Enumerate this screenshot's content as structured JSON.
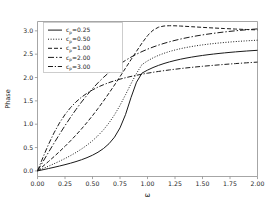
{
  "figure": {
    "background": "#ffffff",
    "line_color": "#1a1a1a",
    "axis_color": "#8f8f8f"
  },
  "chart_data": {
    "type": "line",
    "title": "",
    "xlabel": "ω",
    "ylabel": "Phase",
    "xlim": [
      0.0,
      2.0
    ],
    "ylim": [
      -0.12,
      3.2
    ],
    "grid": false,
    "legend_position": "upper left",
    "xticks": [
      "0.00",
      "0.25",
      "0.50",
      "0.75",
      "1.00",
      "1.25",
      "1.50",
      "1.75",
      "2.00"
    ],
    "xtick_values": [
      0.0,
      0.25,
      0.5,
      0.75,
      1.0,
      1.25,
      1.5,
      1.75,
      2.0
    ],
    "yticks": [
      "0.0",
      "0.5",
      "1.0",
      "1.5",
      "2.0",
      "2.5",
      "3.0"
    ],
    "ytick_values": [
      0.0,
      0.5,
      1.0,
      1.5,
      2.0,
      2.5,
      3.0
    ],
    "x": [
      0.0,
      0.05,
      0.1,
      0.15,
      0.2,
      0.25,
      0.3,
      0.35,
      0.4,
      0.45,
      0.5,
      0.55,
      0.6,
      0.65,
      0.7,
      0.75,
      0.8,
      0.85,
      0.9,
      0.95,
      1.0,
      1.05,
      1.1,
      1.15,
      1.2,
      1.25,
      1.3,
      1.35,
      1.4,
      1.45,
      1.5,
      1.55,
      1.6,
      1.65,
      1.7,
      1.75,
      1.8,
      1.85,
      1.9,
      1.95,
      2.0
    ],
    "series": [
      {
        "name": "c_p=0.25",
        "param": 0.25,
        "linestyle": "solid",
        "dash": "none",
        "values": [
          0.0,
          0.025,
          0.0505,
          0.0767,
          0.1042,
          0.1334,
          0.165,
          0.1998,
          0.2389,
          0.2837,
          0.3364,
          0.4,
          0.4795,
          0.5826,
          0.7226,
          0.9218,
          1.2051,
          1.5708,
          1.9003,
          2.0943,
          2.1588,
          2.2135,
          2.2601,
          2.3002,
          2.3349,
          2.3653,
          2.392,
          2.4157,
          2.4369,
          2.4559,
          2.4731,
          2.4887,
          2.5029,
          2.5159,
          2.5279,
          2.5389,
          2.5491,
          2.5586,
          2.5674,
          2.5756,
          2.5832
        ]
      },
      {
        "name": "c_p=0.50",
        "param": 0.5,
        "linestyle": "dotted",
        "dash": "1,1.6",
        "values": [
          0.0,
          0.05,
          0.1007,
          0.1528,
          0.2073,
          0.265,
          0.327,
          0.3944,
          0.4688,
          0.552,
          0.6462,
          0.7543,
          0.8799,
          1.0273,
          1.2007,
          1.4033,
          1.6306,
          1.8664,
          2.0888,
          2.2774,
          2.3562,
          2.421,
          2.4746,
          2.5195,
          2.5575,
          2.5899,
          2.6179,
          2.6423,
          2.6636,
          2.6825,
          2.6992,
          2.7141,
          2.7276,
          2.7397,
          2.7507,
          2.7607,
          2.7698,
          2.7782,
          2.7859,
          2.793,
          2.7996
        ]
      },
      {
        "name": "c_p=1.00",
        "param": 1.0,
        "linestyle": "dashed",
        "dash": "4,2",
        "values": [
          0.0,
          0.1,
          0.2013,
          0.305,
          0.4129,
          0.5255,
          0.6435,
          0.7679,
          0.899,
          1.0373,
          1.1832,
          1.3367,
          1.4976,
          1.6655,
          1.8395,
          2.0182,
          2.1998,
          2.3819,
          2.5621,
          2.7376,
          2.8966,
          3.0129,
          3.0782,
          3.1037,
          3.1098,
          3.1079,
          3.1026,
          3.0959,
          3.0887,
          3.0815,
          3.0744,
          3.0676,
          3.0611,
          3.0549,
          3.049,
          3.0435,
          3.0382,
          3.0333,
          3.0286,
          3.0241,
          3.0199
        ]
      },
      {
        "name": "c_p=2.00",
        "param": 2.0,
        "linestyle": "dashdot-long",
        "dash": "6,2,1.4,2",
        "values": [
          0.0,
          0.1997,
          0.398,
          0.5934,
          0.7845,
          0.9695,
          1.147,
          1.3157,
          1.4746,
          1.623,
          1.7606,
          1.8872,
          2.003,
          2.1083,
          2.2037,
          2.2898,
          2.3673,
          2.4371,
          2.4998,
          2.5563,
          2.6072,
          2.653,
          2.6943,
          2.7316,
          2.7654,
          2.796,
          2.8238,
          2.8491,
          2.8722,
          2.8933,
          2.9127,
          2.9305,
          2.9469,
          2.9621,
          2.9761,
          2.9891,
          3.0012,
          3.0124,
          3.0228,
          3.0326,
          3.0417
        ]
      },
      {
        "name": "c_p=3.00",
        "param": 3.0,
        "linestyle": "dashdot",
        "dash": "5,1.8,1.2,1.8",
        "values": [
          0.0,
          0.2915,
          0.5669,
          0.8144,
          1.0276,
          1.2067,
          1.3552,
          1.4778,
          1.5793,
          1.6639,
          1.7349,
          1.795,
          1.8466,
          1.8912,
          1.9303,
          1.9649,
          1.9957,
          2.0234,
          2.0486,
          2.0716,
          2.0927,
          2.1122,
          2.1303,
          2.1471,
          2.1629,
          2.1777,
          2.1916,
          2.2048,
          2.2172,
          2.2291,
          2.2404,
          2.2511,
          2.2614,
          2.2713,
          2.2807,
          2.2898,
          2.2985,
          2.3069,
          2.315,
          2.3228,
          2.3304
        ]
      }
    ]
  },
  "legend": {
    "entries": [
      {
        "base": "c",
        "sub": "p",
        "rest": "=0.25"
      },
      {
        "base": "c",
        "sub": "p",
        "rest": "=0.50"
      },
      {
        "base": "c",
        "sub": "p",
        "rest": "=1.00"
      },
      {
        "base": "c",
        "sub": "p",
        "rest": "=2.00"
      },
      {
        "base": "c",
        "sub": "p",
        "rest": "=3.00"
      }
    ]
  }
}
